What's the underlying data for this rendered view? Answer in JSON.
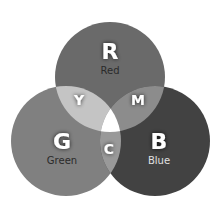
{
  "diagram": {
    "type": "venn",
    "circles": [
      {
        "id": "red",
        "letter": "R",
        "label": "Red",
        "color": "#6a6a6a",
        "label_color": "#2a2a2a"
      },
      {
        "id": "green",
        "letter": "G",
        "label": "Green",
        "color": "#808080",
        "label_color": "#2a2a2a"
      },
      {
        "id": "blue",
        "letter": "B",
        "label": "Blue",
        "color": "#424242",
        "label_color": "#e0e0e0"
      }
    ],
    "overlaps": [
      {
        "id": "yellow",
        "letter": "Y",
        "color": "#c4c4c4"
      },
      {
        "id": "magenta",
        "letter": "M",
        "color": "#8c8c8c"
      },
      {
        "id": "cyan",
        "letter": "C",
        "color": "#999999"
      },
      {
        "id": "white",
        "letter": "",
        "color": "#ffffff"
      }
    ]
  }
}
